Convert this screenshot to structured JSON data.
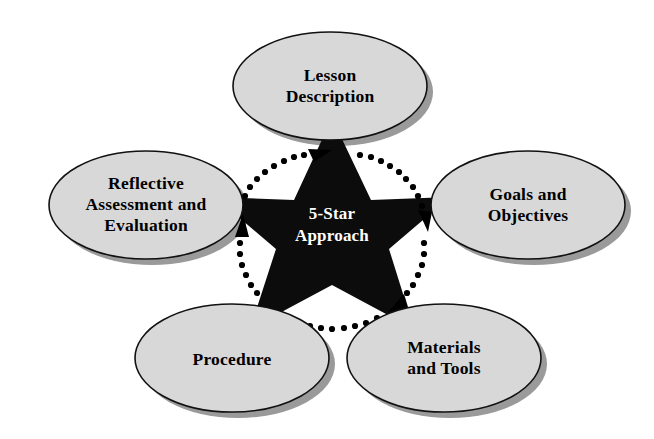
{
  "diagram": {
    "title": "5-Star Approach",
    "center": {
      "name": "center-star",
      "line1": "5-Star",
      "line2": "Approach",
      "shape": "five-pointed-star",
      "fill": "#0c0c0c",
      "text_color": "#ffffff"
    },
    "background_color": "#ffffff",
    "node_fill": "#d8d8d8",
    "node_stroke": "#111111",
    "node_shadow": "#9a9a9a",
    "flow_direction": "clockwise",
    "nodes": [
      {
        "id": "lesson-description",
        "position": "top",
        "lines": [
          "Lesson",
          "Description"
        ],
        "cx": 330,
        "cy": 86,
        "rx": 97,
        "ry": 54
      },
      {
        "id": "goals-and-objectives",
        "position": "right",
        "lines": [
          "Goals and",
          "Objectives"
        ],
        "cx": 528,
        "cy": 205,
        "rx": 97,
        "ry": 54
      },
      {
        "id": "materials-and-tools",
        "position": "bottom-right",
        "lines": [
          "Materials",
          "and Tools"
        ],
        "cx": 444,
        "cy": 358,
        "rx": 97,
        "ry": 54
      },
      {
        "id": "procedure",
        "position": "bottom-left",
        "lines": [
          "Procedure"
        ],
        "cx": 232,
        "cy": 358,
        "rx": 97,
        "ry": 54
      },
      {
        "id": "reflective-assessment-and-evaluation",
        "position": "left",
        "lines": [
          "Reflective",
          "Assessment and",
          "Evaluation"
        ],
        "cx": 146,
        "cy": 205,
        "rx": 97,
        "ry": 54
      }
    ],
    "connectors": [
      {
        "id": "arc-to-lesson-description",
        "from": "reflective-assessment-and-evaluation",
        "to": "lesson-description",
        "style": "dotted-arc-arrow"
      },
      {
        "id": "arc-to-goals-and-objectives",
        "from": "lesson-description",
        "to": "goals-and-objectives",
        "style": "dotted-arc-arrow"
      },
      {
        "id": "arc-to-materials-and-tools",
        "from": "goals-and-objectives",
        "to": "materials-and-tools",
        "style": "dotted-arc-arrow"
      },
      {
        "id": "arc-to-procedure",
        "from": "materials-and-tools",
        "to": "procedure",
        "style": "dotted-arc-arrow"
      },
      {
        "id": "arc-to-reflective-assessment",
        "from": "procedure",
        "to": "reflective-assessment-and-evaluation",
        "style": "dotted-arc-arrow"
      }
    ]
  }
}
